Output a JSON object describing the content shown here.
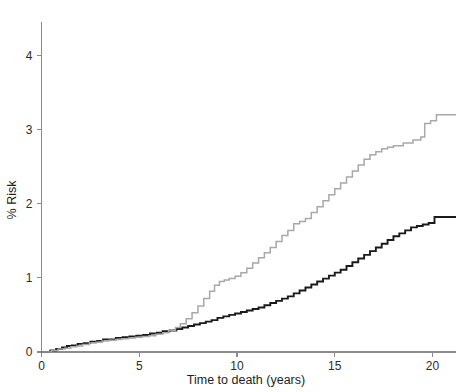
{
  "chart_data": {
    "type": "line",
    "title": "",
    "subtitle": "",
    "xlabel": "Time to death (years)",
    "ylabel": "% Risk",
    "xlim": [
      0,
      21.2
    ],
    "ylim": [
      0,
      4.45
    ],
    "xticks": [
      0,
      5,
      10,
      15,
      20
    ],
    "xticklabels": [
      "0",
      "5",
      "10",
      "15",
      "20"
    ],
    "yticks": [
      0,
      1,
      2,
      3,
      4
    ],
    "yticklabels": [
      "0",
      "1",
      "2",
      "3",
      "4"
    ],
    "grid": false,
    "legend": "none",
    "step_style": "post",
    "series": [
      {
        "name": "black-curve",
        "color": "#1a1a1a",
        "linewidth": 1.9,
        "x": [
          0,
          0.45,
          0.75,
          1.05,
          1.3,
          1.55,
          1.85,
          2.15,
          2.5,
          2.85,
          3.15,
          3.45,
          3.8,
          4.15,
          4.5,
          4.85,
          5.2,
          5.55,
          5.9,
          6.2,
          6.55,
          6.9,
          7.2,
          7.5,
          7.8,
          8.1,
          8.4,
          8.7,
          9.0,
          9.3,
          9.6,
          9.9,
          10.2,
          10.5,
          10.8,
          11.1,
          11.4,
          11.7,
          12.0,
          12.3,
          12.6,
          12.9,
          13.2,
          13.5,
          13.8,
          14.1,
          14.4,
          14.7,
          15.0,
          15.3,
          15.6,
          15.9,
          16.2,
          16.5,
          16.8,
          17.1,
          17.4,
          17.7,
          18.0,
          18.3,
          18.6,
          18.9,
          19.2,
          19.5,
          19.8,
          20.1,
          21.2
        ],
        "y": [
          0.0,
          0.02,
          0.04,
          0.06,
          0.08,
          0.09,
          0.11,
          0.12,
          0.14,
          0.15,
          0.17,
          0.17,
          0.19,
          0.2,
          0.21,
          0.22,
          0.23,
          0.25,
          0.26,
          0.28,
          0.29,
          0.31,
          0.33,
          0.35,
          0.37,
          0.39,
          0.41,
          0.43,
          0.46,
          0.48,
          0.5,
          0.52,
          0.54,
          0.56,
          0.58,
          0.6,
          0.63,
          0.66,
          0.69,
          0.72,
          0.75,
          0.79,
          0.83,
          0.87,
          0.91,
          0.95,
          0.99,
          1.03,
          1.07,
          1.11,
          1.16,
          1.21,
          1.26,
          1.31,
          1.36,
          1.41,
          1.46,
          1.51,
          1.56,
          1.6,
          1.64,
          1.68,
          1.7,
          1.72,
          1.74,
          1.82,
          1.82
        ]
      },
      {
        "name": "grey-curve",
        "color": "#a8a8a8",
        "linewidth": 1.5,
        "x": [
          0,
          0.5,
          0.85,
          1.2,
          1.5,
          1.8,
          2.1,
          2.45,
          2.8,
          3.1,
          3.45,
          3.8,
          4.1,
          4.45,
          4.8,
          5.15,
          5.5,
          5.85,
          6.2,
          6.5,
          6.85,
          7.1,
          7.4,
          7.7,
          8.0,
          8.3,
          8.6,
          8.85,
          9.1,
          9.35,
          9.6,
          9.9,
          10.2,
          10.5,
          10.8,
          11.1,
          11.4,
          11.7,
          12.0,
          12.3,
          12.6,
          12.9,
          13.2,
          13.5,
          13.8,
          14.1,
          14.4,
          14.7,
          15.0,
          15.3,
          15.6,
          15.9,
          16.2,
          16.5,
          16.8,
          17.1,
          17.4,
          17.7,
          18.0,
          18.5,
          19.0,
          19.4,
          19.6,
          19.9,
          20.2,
          21.2
        ],
        "y": [
          0.0,
          0.02,
          0.04,
          0.05,
          0.07,
          0.08,
          0.1,
          0.12,
          0.13,
          0.15,
          0.16,
          0.17,
          0.18,
          0.19,
          0.2,
          0.21,
          0.22,
          0.24,
          0.26,
          0.29,
          0.33,
          0.38,
          0.45,
          0.53,
          0.62,
          0.72,
          0.82,
          0.9,
          0.95,
          0.97,
          0.99,
          1.02,
          1.07,
          1.13,
          1.2,
          1.27,
          1.34,
          1.41,
          1.49,
          1.57,
          1.64,
          1.73,
          1.76,
          1.8,
          1.88,
          1.96,
          2.04,
          2.12,
          2.2,
          2.28,
          2.36,
          2.44,
          2.52,
          2.6,
          2.66,
          2.7,
          2.74,
          2.76,
          2.78,
          2.82,
          2.86,
          2.9,
          3.08,
          3.12,
          3.2,
          3.2
        ]
      }
    ]
  },
  "axes": {
    "y_axis_title": "% Risk",
    "x_axis_title": "Time to death (years)"
  },
  "colors": {
    "axis": "#8b8b8b",
    "text": "#231f20",
    "series_black": "#1a1a1a",
    "series_grey": "#a8a8a8",
    "background": "#ffffff"
  }
}
